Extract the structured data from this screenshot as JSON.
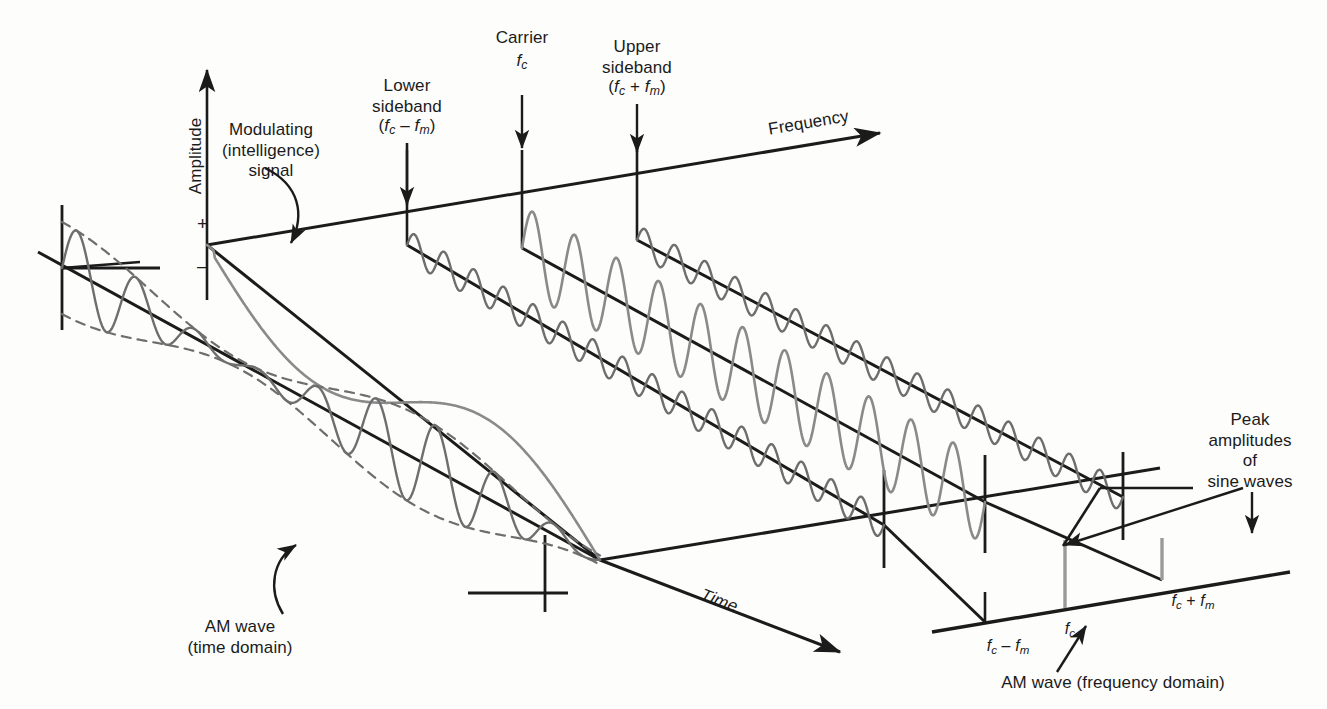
{
  "figure": {
    "colors": {
      "axis": "#1b1b1b",
      "wave": "#6e6e6e",
      "wave_light": "#8a8a8a",
      "stem_gray": "#9a9a9a",
      "background": "#fdfdfc"
    }
  },
  "labels": {
    "amplitude": "Amplitude",
    "plus": "+",
    "minus": "–",
    "frequency": "Frequency",
    "time": "Time",
    "modulating_signal": "Modulating\n(intelligence)\nsignal",
    "lower_sideband": "Lower\nsideband",
    "lower_sideband_expr_open": "(",
    "lower_sideband_expr": "f_c – f_m",
    "carrier": "Carrier",
    "carrier_expr": "f_c",
    "upper_sideband": "Upper\nsideband",
    "upper_sideband_expr": "(f_c + f_m)",
    "am_wave_time": "AM wave\n(time domain)",
    "peak_amplitudes": "Peak\namplitudes\nof\nsine waves",
    "am_wave_frequency": "AM wave (frequency domain)",
    "tick_lower": "f_c – f_m",
    "tick_carrier": "f_c",
    "tick_upper": "f_c + f_m"
  },
  "chart_data": {
    "type": "line",
    "xlabel": "Frequency",
    "ylabel": "Amplitude",
    "zlabel": "Time",
    "grid": false,
    "legend": "none",
    "series": [
      {
        "name": "lower-sideband-sine",
        "label": "Lower sideband (fc - fm)",
        "frequency_label": "f_c - f_m",
        "relative_amplitude": 0.45,
        "cycles": 16,
        "color": "#6e6e6e"
      },
      {
        "name": "carrier-sine",
        "label": "Carrier (fc)",
        "frequency_label": "f_c",
        "relative_amplitude": 1.0,
        "cycles": 11,
        "color": "#8a8a8a"
      },
      {
        "name": "upper-sideband-sine",
        "label": "Upper sideband (fc + fm)",
        "frequency_label": "f_c + f_m",
        "relative_amplitude": 0.45,
        "cycles": 16,
        "color": "#6e6e6e"
      },
      {
        "name": "am-wave-time-domain",
        "label": "AM wave (time domain)",
        "relative_amplitude": 1.0,
        "cycles": 9,
        "envelope": "modulated",
        "color": "#6e6e6e"
      },
      {
        "name": "modulating-signal",
        "label": "Modulating (intelligence) signal",
        "relative_amplitude": 0.8,
        "cycles": 1.5,
        "color": "#8a8a8a"
      }
    ],
    "spectrum": {
      "categories": [
        "f_c – f_m",
        "f_c",
        "f_c + f_m"
      ],
      "values": [
        0.45,
        1.0,
        0.45
      ],
      "ylabel": "Amplitude",
      "xlabel": "Frequency"
    }
  }
}
